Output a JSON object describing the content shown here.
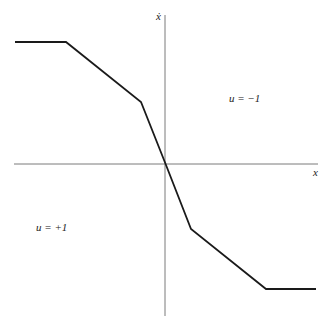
{
  "figure": {
    "axes": {
      "x_label": "x",
      "y_label": "ẋ",
      "x_axis": {
        "x1": 14,
        "x2": 318,
        "y": 164
      },
      "y_axis": {
        "x": 165,
        "y1": 15,
        "y2": 316
      },
      "color": "#7a7a7a"
    },
    "curve": {
      "color": "#1a1a1a",
      "points": [
        [
          15,
          42
        ],
        [
          66,
          42
        ],
        [
          141,
          102
        ],
        [
          166,
          165
        ],
        [
          191,
          229
        ],
        [
          266,
          289
        ],
        [
          316,
          289
        ]
      ]
    },
    "regions": [
      {
        "label": "u = −1",
        "x": 229,
        "y": 92
      },
      {
        "label": "u = +1",
        "x": 36,
        "y": 221
      }
    ]
  },
  "chart_data": {
    "type": "line",
    "title": "",
    "xlabel": "x",
    "ylabel": "ẋ",
    "series": [
      {
        "name": "switching curve",
        "x": [
          -1.0,
          -0.66,
          -0.16,
          0,
          0.16,
          0.66,
          1.0
        ],
        "y": [
          0.82,
          0.82,
          0.41,
          0,
          -0.43,
          -0.82,
          -0.82
        ]
      }
    ],
    "annotations": [
      "u = −1",
      "u = +1"
    ],
    "grid": false
  }
}
